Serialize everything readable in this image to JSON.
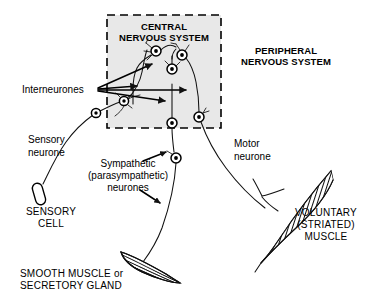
{
  "diagram": {
    "regions": {
      "cns": {
        "label_line1": "CENTRAL",
        "label_line2": "NERVOUS SYSTEM",
        "name": "central-nervous-system",
        "fill": "#e8e8e8",
        "border_style": "dashed"
      },
      "pns": {
        "label_line1": "PERIPHERAL",
        "label_line2": "NERVOUS SYSTEM",
        "name": "peripheral-nervous-system"
      }
    },
    "labels": {
      "interneurones": "Interneurones",
      "sensory_neurone_l1": "Sensory",
      "sensory_neurone_l2": "neurone",
      "motor_neurone_l1": "Motor",
      "motor_neurone_l2": "neurone",
      "sympathetic_l1": "Sympathetic",
      "sympathetic_l2": "(parasympathetic)",
      "sympathetic_l3": "neurones",
      "sensory_cell_l1": "SENSORY",
      "sensory_cell_l2": "CELL",
      "smooth_muscle_l1": "SMOOTH MUSCLE or",
      "smooth_muscle_l2": "SECRETORY GLAND",
      "voluntary_muscle_l1": "VOLUNTARY",
      "voluntary_muscle_l2": "(STRIATED)",
      "voluntary_muscle_l3": "MUSCLE"
    },
    "colors": {
      "ink": "#111111",
      "cns_shade": "#e8e8e8",
      "background": "#ffffff"
    },
    "structures": [
      {
        "name": "sensory-receptor-capsule",
        "kind": "capsule"
      },
      {
        "name": "smooth-muscle-organ",
        "kind": "lens-striped"
      },
      {
        "name": "voluntary-striated-muscle",
        "kind": "spindle-hatched"
      }
    ],
    "neuron_somas": [
      {
        "name": "soma-sensory-ganglion",
        "x": 96,
        "y": 113
      },
      {
        "name": "soma-sensory-entry",
        "x": 124,
        "y": 101
      },
      {
        "name": "soma-interneurone-left",
        "x": 156,
        "y": 51
      },
      {
        "name": "soma-interneurone-right",
        "x": 182,
        "y": 55
      },
      {
        "name": "soma-interneurone-mid",
        "x": 172,
        "y": 69
      },
      {
        "name": "soma-preganglionic",
        "x": 172,
        "y": 123
      },
      {
        "name": "soma-motor",
        "x": 199,
        "y": 117
      },
      {
        "name": "soma-postganglionic",
        "x": 176,
        "y": 158
      }
    ]
  }
}
